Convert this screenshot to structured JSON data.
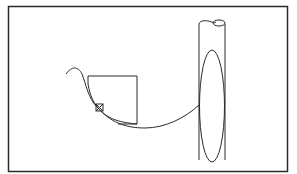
{
  "diagram": {
    "type": "line-illustration",
    "background": "#ffffff",
    "stroke": "#2a2a2a",
    "frame": {
      "x": 8,
      "y": 6,
      "width": 280,
      "height": 166
    },
    "elements": [
      {
        "id": "square",
        "shape": "rect",
        "x": 87,
        "y": 76,
        "width": 50,
        "height": 48
      },
      {
        "id": "marker",
        "shape": "crossed-square",
        "cx": 99,
        "cy": 107,
        "size": 7
      },
      {
        "id": "tube",
        "shape": "cylinder",
        "x": 198,
        "top": 22,
        "bottom": 165,
        "width": 27
      },
      {
        "id": "ellipse",
        "shape": "ellipse",
        "cx": 212,
        "cy": 106,
        "rx": 12,
        "ry": 56
      }
    ]
  }
}
